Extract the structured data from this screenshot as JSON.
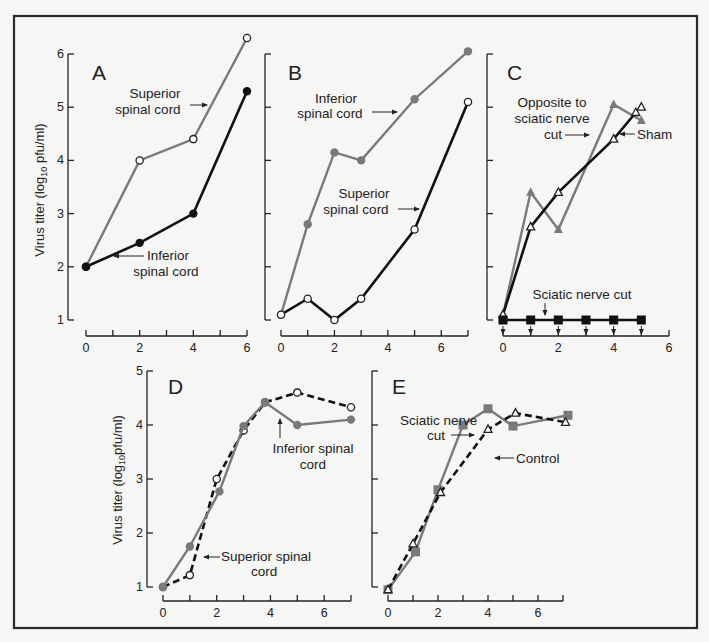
{
  "figure": {
    "ylabel_top": "Virus titer (log10 pfu/ml)",
    "ylabel_bottom": "Virus titer (log10 pfu/ml)",
    "colors": {
      "gray_series": "#7a7a7a",
      "black_series": "#111111",
      "open_marker_fill": "#ffffff",
      "background": "#f6f6f4"
    }
  },
  "chart_data": [
    {
      "panel": "A",
      "type": "line",
      "x_ticks": [
        0,
        1,
        2,
        3,
        4,
        5,
        6
      ],
      "x_tick_labels": [
        "0",
        "2",
        "4",
        "6"
      ],
      "y_ticks": [
        1,
        2,
        3,
        4,
        5,
        6
      ],
      "ylim": [
        1,
        6
      ],
      "xlim": [
        0,
        6
      ],
      "ylabel": "Virus titer (log10 pfu/ml)",
      "series": [
        {
          "name": "Superior spinal cord",
          "marker": "open-circle",
          "color": "#7a7a7a",
          "dash": false,
          "x": [
            0,
            2,
            4,
            6
          ],
          "y": [
            2.0,
            4.0,
            4.4,
            6.3
          ]
        },
        {
          "name": "Inferior spinal cord",
          "marker": "filled-circle",
          "color": "#111111",
          "dash": false,
          "x": [
            0,
            2,
            4,
            6
          ],
          "y": [
            2.0,
            2.45,
            3.0,
            5.3
          ]
        }
      ],
      "annotations": [
        "Superior spinal cord",
        "Inferior spinal cord"
      ]
    },
    {
      "panel": "B",
      "type": "line",
      "x_ticks": [
        0,
        1,
        2,
        3,
        4,
        5,
        6,
        7
      ],
      "x_tick_labels": [
        "0",
        "2",
        "4",
        "6"
      ],
      "y_ticks": [
        1,
        2,
        3,
        4,
        5,
        6
      ],
      "ylim": [
        1,
        6
      ],
      "xlim": [
        0,
        7
      ],
      "series": [
        {
          "name": "Inferior spinal cord",
          "marker": "filled-circle",
          "color": "#7a7a7a",
          "dash": false,
          "x": [
            0,
            1,
            2,
            3,
            5,
            7
          ],
          "y": [
            1.1,
            2.8,
            4.15,
            4.0,
            5.15,
            6.05
          ]
        },
        {
          "name": "Superior spinal cord",
          "marker": "open-circle",
          "color": "#111111",
          "dash": false,
          "x": [
            0,
            1,
            2,
            3,
            5,
            7
          ],
          "y": [
            1.1,
            1.4,
            1.0,
            1.4,
            2.7,
            5.1
          ]
        }
      ],
      "annotations": [
        "Inferior spinal cord",
        "Superior spinal cord"
      ]
    },
    {
      "panel": "C",
      "type": "line",
      "x_ticks": [
        0,
        1,
        2,
        3,
        4,
        5,
        6
      ],
      "x_tick_labels": [
        "0",
        "2",
        "4",
        "6"
      ],
      "y_ticks": [
        1,
        2,
        3,
        4,
        5,
        6
      ],
      "ylim": [
        1,
        6
      ],
      "xlim": [
        0,
        6
      ],
      "series": [
        {
          "name": "Opposite to sciatic nerve cut",
          "marker": "filled-triangle",
          "color": "#7a7a7a",
          "dash": false,
          "x": [
            0,
            1,
            2,
            4,
            5
          ],
          "y": [
            1.1,
            3.4,
            2.7,
            5.05,
            4.75
          ]
        },
        {
          "name": "Sham",
          "marker": "open-triangle",
          "color": "#111111",
          "dash": false,
          "x": [
            0,
            1,
            2,
            4,
            4.8
          ],
          "y": [
            1.1,
            2.75,
            3.4,
            4.4,
            4.9
          ],
          "extra_point": {
            "x": 5,
            "y": 5.0
          }
        },
        {
          "name": "Sciatic nerve cut",
          "marker": "filled-square",
          "color": "#111111",
          "dash": false,
          "x": [
            0,
            1,
            2,
            3,
            4,
            5
          ],
          "y": [
            1.0,
            1.0,
            1.0,
            1.0,
            1.0,
            1.0
          ],
          "below_detection_arrows": true
        }
      ],
      "annotations": [
        "Opposite to sciatic nerve cut",
        "Sham",
        "Sciatic nerve cut"
      ]
    },
    {
      "panel": "D",
      "type": "line",
      "x_ticks": [
        0,
        1,
        2,
        3,
        4,
        5,
        6,
        7
      ],
      "x_tick_labels": [
        "0",
        "2",
        "4",
        "6"
      ],
      "y_ticks": [
        1,
        2,
        3,
        4,
        5
      ],
      "ylim": [
        1,
        5
      ],
      "xlim": [
        0,
        7
      ],
      "ylabel": "Virus titer (log10 pfu/ml)",
      "series": [
        {
          "name": "Superior spinal cord",
          "marker": "open-circle",
          "color": "#111111",
          "dash": true,
          "x": [
            0,
            1,
            2,
            3,
            3.8,
            5,
            7
          ],
          "y": [
            1.0,
            1.22,
            3.0,
            3.9,
            4.42,
            4.6,
            4.33
          ]
        },
        {
          "name": "Inferior spinal cord",
          "marker": "filled-circle",
          "color": "#7a7a7a",
          "dash": false,
          "x": [
            0,
            1,
            2.1,
            3,
            3.8,
            5,
            7
          ],
          "y": [
            1.0,
            1.75,
            2.77,
            3.98,
            4.42,
            4.0,
            4.1
          ]
        }
      ],
      "annotations": [
        "Inferior spinal cord",
        "Superior spinal cord"
      ]
    },
    {
      "panel": "E",
      "type": "line",
      "x_ticks": [
        0,
        1,
        2,
        3,
        4,
        5,
        6,
        7
      ],
      "x_tick_labels": [
        "0",
        "2",
        "4",
        "6"
      ],
      "y_ticks": [
        1,
        2,
        3,
        4,
        5
      ],
      "ylim": [
        1,
        5
      ],
      "xlim": [
        0,
        7
      ],
      "series": [
        {
          "name": "Sciatic nerve cut",
          "marker": "filled-square",
          "color": "#7a7a7a",
          "dash": false,
          "x": [
            0,
            1.1,
            2,
            3,
            4,
            5,
            7.2
          ],
          "y": [
            0.95,
            1.65,
            2.8,
            4.0,
            4.3,
            3.98,
            4.18
          ]
        },
        {
          "name": "Control",
          "marker": "open-triangle",
          "color": "#111111",
          "dash": true,
          "x": [
            0,
            1,
            2.1,
            4,
            5.1,
            7.1
          ],
          "y": [
            0.95,
            1.8,
            2.75,
            3.92,
            4.22,
            4.05
          ]
        }
      ],
      "annotations": [
        "Sciatic nerve cut",
        "Control"
      ]
    }
  ],
  "labels": {
    "A": "A",
    "B": "B",
    "C": "C",
    "D": "D",
    "E": "E",
    "a_sup_1": "Superior",
    "a_sup_2": "spinal cord",
    "a_inf_1": "Inferior",
    "a_inf_2": "spinal cord",
    "b_inf_1": "Inferior",
    "b_inf_2": "spinal cord",
    "b_sup_1": "Superior",
    "b_sup_2": "spinal cord",
    "c_opp_1": "Opposite to",
    "c_opp_2": "sciatic nerve",
    "c_opp_3": "cut",
    "c_sham": "Sham",
    "c_cut": "Sciatic nerve cut",
    "d_inf_1": "Inferior spinal",
    "d_inf_2": "cord",
    "d_sup_1": "Superior spinal",
    "d_sup_2": "cord",
    "e_cut_1": "Sciatic nerve",
    "e_cut_2": "cut",
    "e_ctrl": "Control",
    "ytick": [
      "1",
      "2",
      "3",
      "4",
      "5",
      "6"
    ],
    "xtick": [
      "0",
      "2",
      "4",
      "6"
    ]
  }
}
